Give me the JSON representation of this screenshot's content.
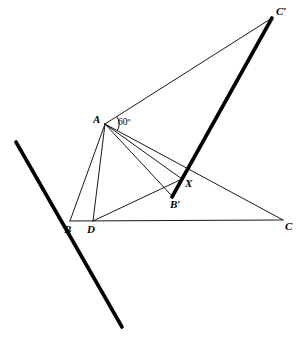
{
  "figure": {
    "width": 300,
    "height": 346,
    "background_color": "#ffffff",
    "ink_color": "#000000"
  },
  "points": {
    "A": {
      "label": "A",
      "x": 105,
      "y": 124,
      "label_x": 93,
      "label_y": 114
    },
    "B": {
      "label": "B",
      "x": 70,
      "y": 221,
      "label_x": 64,
      "label_y": 224
    },
    "C": {
      "label": "C",
      "x": 283,
      "y": 220,
      "label_x": 285,
      "label_y": 221
    },
    "D": {
      "label": "D",
      "x": 93,
      "y": 221,
      "label_x": 87,
      "label_y": 224
    },
    "Bp": {
      "label": "B′",
      "x": 172,
      "y": 196,
      "label_x": 170,
      "label_y": 199
    },
    "Cp": {
      "label": "C′",
      "x": 272,
      "y": 18,
      "label_x": 276,
      "label_y": 6
    },
    "X": {
      "label": "X",
      "x": 182,
      "y": 179,
      "label_x": 185,
      "label_y": 178
    }
  },
  "angle_marker": {
    "label": "60º",
    "vertex": "A",
    "label_x": 118,
    "label_y": 118,
    "arc_radius": 14
  },
  "thin_segments": [
    {
      "name": "segment-A-B",
      "from": "A",
      "to": "B"
    },
    {
      "name": "segment-A-D",
      "from": "A",
      "to": "D"
    },
    {
      "name": "segment-A-Bp",
      "from": "A",
      "to": "Bp"
    },
    {
      "name": "segment-A-X",
      "from": "A",
      "to": "X"
    },
    {
      "name": "segment-A-C",
      "from": "A",
      "to": "C"
    },
    {
      "name": "segment-A-Cp",
      "from": "A",
      "to": "Cp"
    },
    {
      "name": "segment-B-C",
      "from": "B",
      "to": "C"
    },
    {
      "name": "segment-D-X",
      "from": "D",
      "to": "X"
    }
  ],
  "thick_segments": [
    {
      "name": "segment-Bp-Cp",
      "x1": 172,
      "y1": 197,
      "x2": 272,
      "y2": 18
    },
    {
      "name": "mirror-line",
      "x1": 16,
      "y1": 142,
      "x2": 122,
      "y2": 327
    }
  ],
  "stroke_widths": {
    "thin": 0.9,
    "thick": 3.6
  }
}
